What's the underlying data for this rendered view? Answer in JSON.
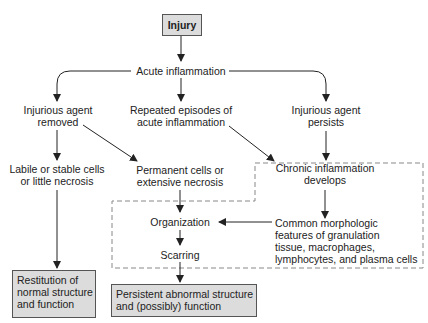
{
  "diagram": {
    "title_node": "Injury",
    "nodes": {
      "acute": "Acute inflammation",
      "removed": [
        "Injurious agent",
        "removed"
      ],
      "repeated": [
        "Repeated episodes of",
        "acute inflammation"
      ],
      "persists": [
        "Injurious agent",
        "persists"
      ],
      "labile": [
        "Labile or stable cells",
        "or little necrosis"
      ],
      "permanent": [
        "Permanent cells or",
        "extensive necrosis"
      ],
      "chronic": [
        "Chronic inflammation",
        "develops"
      ],
      "organization": "Organization",
      "scarring": "Scarring",
      "morphologic": [
        "Common morphologic",
        "features of granulation",
        "tissue, macrophages,",
        "lymphocytes, and plasma cells"
      ],
      "restitution": [
        "Restitution of",
        "normal structure",
        "and function"
      ],
      "persistent": [
        "Persistent abnormal structure",
        "and (possibly) function"
      ]
    },
    "colors": {
      "box_fill": "#dcdcdc",
      "box_border": "#555555",
      "line": "#222222",
      "dashed": "#888888"
    }
  }
}
